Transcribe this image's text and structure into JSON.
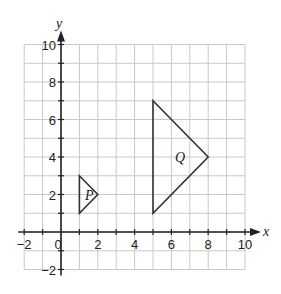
{
  "diagram": {
    "type": "coordinate-grid-transformation",
    "axes": {
      "x_label": "x",
      "y_label": "y",
      "x_range": [
        -2,
        10
      ],
      "y_range": [
        -2,
        10
      ],
      "x_ticks": [
        "-2",
        "0",
        "2",
        "4",
        "6",
        "8",
        "10"
      ],
      "y_ticks": [
        "-2",
        "2",
        "4",
        "6",
        "8",
        "10"
      ],
      "origin_label": "0"
    },
    "shapes": [
      {
        "label": "P",
        "vertices": [
          [
            1,
            3
          ],
          [
            2,
            2
          ],
          [
            1,
            1
          ]
        ],
        "label_pos": [
          1.3,
          2
        ]
      },
      {
        "label": "Q",
        "vertices": [
          [
            5,
            7
          ],
          [
            8,
            4
          ],
          [
            5,
            1
          ]
        ],
        "label_pos": [
          6.2,
          4
        ]
      }
    ],
    "colors": {
      "grid": "#c8c8c8",
      "axis": "#222222",
      "shape": "#333333"
    }
  }
}
